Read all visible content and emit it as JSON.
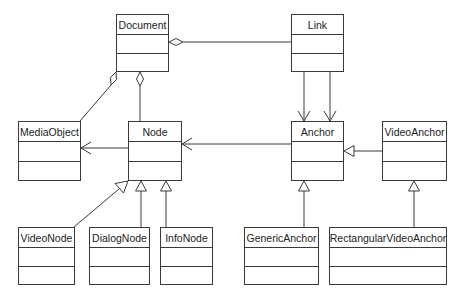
{
  "diagram": {
    "type": "uml-class-diagram",
    "classes": [
      {
        "id": "document",
        "name": "Document",
        "x": 116,
        "y": 14,
        "w": 53,
        "h": 58
      },
      {
        "id": "link",
        "name": "Link",
        "x": 291,
        "y": 14,
        "w": 53,
        "h": 58
      },
      {
        "id": "mediaobject",
        "name": "MediaObject",
        "x": 18,
        "y": 121,
        "w": 63,
        "h": 60
      },
      {
        "id": "node",
        "name": "Node",
        "x": 128,
        "y": 121,
        "w": 54,
        "h": 60
      },
      {
        "id": "anchor",
        "name": "Anchor",
        "x": 291,
        "y": 121,
        "w": 53,
        "h": 60
      },
      {
        "id": "videoanchor",
        "name": "VideoAnchor",
        "x": 382,
        "y": 121,
        "w": 65,
        "h": 60
      },
      {
        "id": "videonode",
        "name": "VideoNode",
        "x": 18,
        "y": 227,
        "w": 57,
        "h": 58
      },
      {
        "id": "dialognode",
        "name": "DialogNode",
        "x": 89,
        "y": 227,
        "w": 61,
        "h": 58
      },
      {
        "id": "infonode",
        "name": "InfoNode",
        "x": 160,
        "y": 227,
        "w": 53,
        "h": 58
      },
      {
        "id": "genericanchor",
        "name": "GenericAnchor",
        "x": 244,
        "y": 227,
        "w": 75,
        "h": 58
      },
      {
        "id": "rectangularvideoanchor",
        "name": "RectangularVideoAnchor",
        "x": 329,
        "y": 227,
        "w": 118,
        "h": 58
      }
    ],
    "relationships": [
      {
        "type": "aggregation",
        "whole": "Document",
        "part": "Link"
      },
      {
        "type": "aggregation",
        "whole": "Document",
        "part": "MediaObject"
      },
      {
        "type": "aggregation",
        "whole": "Document",
        "part": "Node"
      },
      {
        "type": "association",
        "from": "Link",
        "to": "Anchor",
        "count": 2
      },
      {
        "type": "association",
        "from": "Node",
        "to": "MediaObject"
      },
      {
        "type": "association",
        "from": "Anchor",
        "to": "Node"
      },
      {
        "type": "generalization",
        "child": "VideoAnchor",
        "parent": "Anchor"
      },
      {
        "type": "generalization",
        "child": "VideoNode",
        "parent": "Node"
      },
      {
        "type": "generalization",
        "child": "DialogNode",
        "parent": "Node"
      },
      {
        "type": "generalization",
        "child": "InfoNode",
        "parent": "Node"
      },
      {
        "type": "generalization",
        "child": "GenericAnchor",
        "parent": "Anchor"
      },
      {
        "type": "generalization",
        "child": "RectangularVideoAnchor",
        "parent": "VideoAnchor"
      }
    ],
    "colors": {
      "line": "#3a3a3a",
      "background": "#ffffff",
      "text": "#222222"
    }
  }
}
